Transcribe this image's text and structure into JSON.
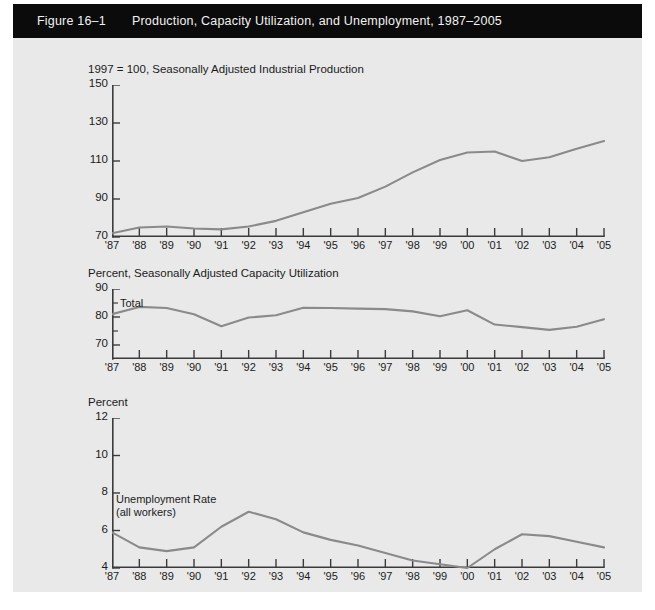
{
  "header": {
    "figure_label": "Figure 16–1",
    "title": "Production, Capacity Utilization, and Unemployment, 1987–2005",
    "bar_color": "#0b0b0b",
    "text_color": "#f2f2f2"
  },
  "page": {
    "background": "#e9e9e9",
    "line_color": "#8a8a8a",
    "axis_color": "#3b3b3b"
  },
  "panels": [
    {
      "title": "1997 = 100, Seasonally Adjusted Industrial Production"
    },
    {
      "title": "Percent, Seasonally Adjusted Capacity Utilization"
    },
    {
      "title": "Percent"
    }
  ],
  "annotations": {
    "capacity_total": "Total",
    "unemployment_line1": "Unemployment Rate",
    "unemployment_line2": "(all workers)"
  },
  "chart_data": [
    {
      "type": "line",
      "title": "1997 = 100, Seasonally Adjusted Industrial Production",
      "xlabel": "",
      "ylabel": "1997 = 100",
      "x": [
        "'87",
        "'88",
        "'89",
        "'90",
        "'91",
        "'92",
        "'93",
        "'94",
        "'95",
        "'96",
        "'97",
        "'98",
        "'99",
        "'00",
        "'01",
        "'02",
        "'03",
        "'04",
        "'05"
      ],
      "ytick_labels": [
        "150",
        "130",
        "110",
        "90",
        "70"
      ],
      "ytick_values": [
        150,
        130,
        110,
        90,
        70
      ],
      "ylim": [
        70,
        150
      ],
      "grid": false,
      "legend": "none",
      "series": [
        {
          "name": "Industrial Production",
          "color": "#8a8a8a",
          "values": [
            72.0,
            75.0,
            75.5,
            74.5,
            74.0,
            75.5,
            78.5,
            83.0,
            87.5,
            90.5,
            96.5,
            104.0,
            110.5,
            114.5,
            115.0,
            110.0,
            112.0,
            116.5,
            120.5
          ]
        }
      ]
    },
    {
      "type": "line",
      "title": "Percent, Seasonally Adjusted Capacity Utilization",
      "xlabel": "",
      "ylabel": "Percent",
      "x": [
        "'87",
        "'88",
        "'89",
        "'90",
        "'91",
        "'92",
        "'93",
        "'94",
        "'95",
        "'96",
        "'97",
        "'98",
        "'99",
        "'00",
        "'01",
        "'02",
        "'03",
        "'04",
        "'05"
      ],
      "ytick_labels": [
        "90",
        "80",
        "70"
      ],
      "ytick_values": [
        90,
        80,
        70
      ],
      "ylim": [
        65,
        90
      ],
      "grid": false,
      "legend": "none",
      "series": [
        {
          "name": "Total",
          "color": "#8a8a8a",
          "values": [
            81.0,
            83.6,
            83.2,
            81.0,
            76.7,
            79.8,
            80.6,
            83.3,
            83.2,
            83.0,
            82.8,
            82.0,
            80.3,
            82.4,
            77.3,
            76.4,
            75.4,
            76.5,
            79.2
          ]
        }
      ]
    },
    {
      "type": "line",
      "title": "Percent",
      "xlabel": "",
      "ylabel": "Percent",
      "x": [
        "'87",
        "'88",
        "'89",
        "'90",
        "'91",
        "'92",
        "'93",
        "'94",
        "'95",
        "'96",
        "'97",
        "'98",
        "'99",
        "'00",
        "'01",
        "'02",
        "'03",
        "'04",
        "'05"
      ],
      "ytick_labels": [
        "12",
        "10",
        "8",
        "6",
        "4"
      ],
      "ytick_values": [
        12,
        10,
        8,
        6,
        4
      ],
      "ylim": [
        4,
        12
      ],
      "grid": false,
      "legend": "none",
      "series": [
        {
          "name": "Unemployment Rate (all workers)",
          "color": "#8a8a8a",
          "values": [
            5.9,
            5.1,
            4.9,
            5.1,
            6.2,
            7.0,
            6.6,
            5.9,
            5.5,
            5.2,
            4.8,
            4.4,
            4.2,
            4.0,
            5.0,
            5.8,
            5.7,
            5.4,
            5.1
          ]
        }
      ]
    }
  ]
}
